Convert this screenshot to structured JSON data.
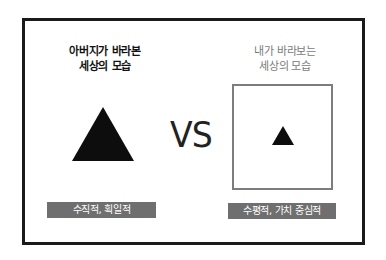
{
  "left_panel": {
    "caption_line1": "아버지가 바라본",
    "caption_line2": "세상의 모습",
    "shape": "large-black-triangle",
    "label": "수직적, 획일적"
  },
  "center": {
    "text": "VS"
  },
  "right_panel": {
    "caption_line1": "내가 바라보는",
    "caption_line2": "세상의 모습",
    "shape": "small-black-triangle-in-square",
    "label": "수평적, 가치 중심적"
  },
  "colors": {
    "frame": "#1a1a1a",
    "triangle": "#0d0d0d",
    "square_border": "#7d7d7d",
    "label_bg": "#6f6f6f",
    "label_text": "#ffffff",
    "right_caption": "#7a7a7a"
  }
}
